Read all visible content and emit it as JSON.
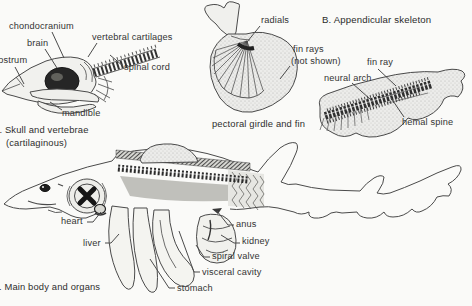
{
  "a": {
    "chondrocranium": "chondocranium",
    "chondrocranium_fix": "chondocranium",
    "label_chondrocranium": "chondocranium",
    "labels_note": "",
    "chondro": "chondocranium",
    "chondrocranium_text": "chondocranium",
    "brain": "brain",
    "rostrum": "rostrum",
    "vertebral_cartilages": "vertebral cartilages",
    "spinal_cord": "spinal cord",
    "mandible": "mandible",
    "caption1": "A. Skull and vertebrae",
    "caption2": "(cartilaginous)"
  },
  "pectoral": {
    "radials": "radials",
    "fin_rays1": "fin rays",
    "fin_rays2": "(not shown)",
    "caption": "pectoral girdle and fin"
  },
  "b": {
    "heading": "B. Appendicular skeleton",
    "fin_ray": "fin ray",
    "neural_arch": "neural arch",
    "hemal_spine": "hemal spine"
  },
  "c": {
    "heart": "heart",
    "liver": "liver",
    "anus": "anus",
    "kidney": "kidney",
    "spiral_valve": "spiral valve",
    "visceral_cavity": "visceral cavity",
    "stomach": "stomach",
    "caption": "C. Main body and organs"
  },
  "colors": {
    "ink": "#3a3a3a",
    "line": "#4a4a4a",
    "paper": "#fafaf8",
    "shade": "#e8e8e4",
    "dark": "#222222"
  }
}
